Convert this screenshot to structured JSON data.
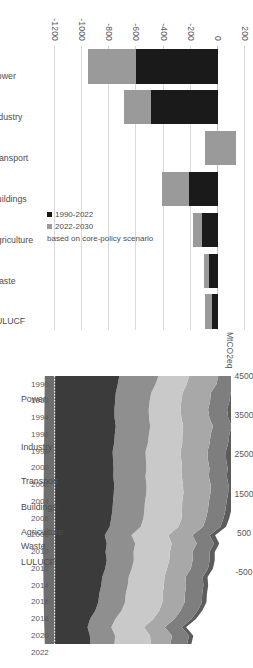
{
  "figures": {
    "bar": {
      "ylabel": "",
      "yticks": [
        "200",
        "0",
        "-200",
        "-400",
        "-600",
        "-800",
        "-1000",
        "-1200"
      ],
      "legend": {
        "hist_label": "1990-2022",
        "proj_label": "2022-2030",
        "note": "based on core-policy scenario"
      }
    },
    "area": {
      "ylabel": "MtCO2eq",
      "yticks": [
        "4500",
        "3500",
        "2500",
        "1500",
        "500",
        "-500"
      ]
    }
  },
  "chart_data": [
    {
      "type": "bar",
      "title": "",
      "xlabel": "",
      "ylabel": "",
      "ylim": [
        -1200,
        200
      ],
      "grid": true,
      "legend_position": "inside-right",
      "categories": [
        "Power",
        "Industry",
        "Transport",
        "Buildings",
        "Agriculture",
        "Waste",
        "LULUCF"
      ],
      "series": [
        {
          "name": "1990-2022",
          "color": "#1a1a1a",
          "values": [
            -600,
            -490,
            135,
            -210,
            -120,
            -65,
            -40
          ]
        },
        {
          "name": "2022-2030",
          "color": "#9a9a9a",
          "values": [
            -360,
            -200,
            -230,
            -205,
            -65,
            -35,
            -55
          ]
        }
      ],
      "annotations": [
        "based on core-policy scenario"
      ]
    },
    {
      "type": "area",
      "stacked": true,
      "title": "",
      "xlabel": "",
      "ylabel": "MtCO2eq",
      "ylim": [
        -500,
        4500
      ],
      "grid": false,
      "x": [
        1990,
        1991,
        1992,
        1993,
        1994,
        1995,
        1996,
        1997,
        1998,
        1999,
        2000,
        2001,
        2002,
        2003,
        2004,
        2005,
        2006,
        2007,
        2008,
        2009,
        2010,
        2011,
        2012,
        2013,
        2014,
        2015,
        2016,
        2017,
        2018,
        2019,
        2020,
        2021,
        2022
      ],
      "xticks": [
        "1990",
        "1992",
        "1994",
        "1996",
        "1998",
        "2000",
        "2002",
        "2004",
        "2006",
        "2008",
        "2010",
        "2012",
        "2014",
        "2016",
        "2018",
        "2020",
        "2022"
      ],
      "series": [
        {
          "name": "Power",
          "color": "#3b3b3b",
          "values": [
            1650,
            1610,
            1560,
            1545,
            1525,
            1530,
            1560,
            1535,
            1520,
            1480,
            1490,
            1505,
            1500,
            1520,
            1510,
            1490,
            1475,
            1445,
            1405,
            1280,
            1330,
            1300,
            1330,
            1290,
            1215,
            1190,
            1140,
            1115,
            1040,
            905,
            840,
            900,
            910
          ]
        },
        {
          "name": "Industry",
          "color": "#8f8f8f",
          "values": [
            1000,
            960,
            905,
            880,
            875,
            880,
            880,
            870,
            860,
            840,
            840,
            835,
            820,
            825,
            830,
            815,
            815,
            820,
            790,
            680,
            725,
            715,
            690,
            675,
            675,
            675,
            675,
            680,
            670,
            645,
            605,
            645,
            615
          ]
        },
        {
          "name": "Transport",
          "color": "#c9c9c9",
          "values": [
            785,
            795,
            800,
            805,
            815,
            825,
            840,
            855,
            875,
            895,
            900,
            910,
            925,
            930,
            945,
            950,
            960,
            975,
            965,
            940,
            930,
            925,
            905,
            900,
            910,
            925,
            940,
            955,
            960,
            965,
            835,
            890,
            925
          ]
        },
        {
          "name": "Buildings",
          "color": "#a8a8a8",
          "values": [
            740,
            760,
            720,
            735,
            700,
            715,
            760,
            720,
            700,
            685,
            680,
            700,
            690,
            705,
            690,
            680,
            660,
            620,
            625,
            615,
            640,
            575,
            595,
            610,
            540,
            565,
            570,
            565,
            545,
            540,
            530,
            560,
            500
          ]
        },
        {
          "name": "Agriculture",
          "color": "#7e7e7e",
          "values": [
            545,
            530,
            505,
            495,
            485,
            480,
            478,
            475,
            472,
            468,
            465,
            463,
            458,
            455,
            452,
            450,
            448,
            447,
            446,
            442,
            440,
            438,
            437,
            436,
            438,
            440,
            441,
            440,
            438,
            435,
            432,
            434,
            430
          ]
        },
        {
          "name": "Waste",
          "color": "#5c5c5c",
          "values": [
            230,
            225,
            220,
            215,
            210,
            205,
            200,
            195,
            190,
            185,
            180,
            175,
            170,
            165,
            160,
            155,
            150,
            146,
            142,
            138,
            135,
            132,
            129,
            126,
            124,
            122,
            120,
            118,
            116,
            114,
            112,
            110,
            108
          ]
        },
        {
          "name": "LULUCF",
          "color": "#6e6e6e",
          "values": [
            -250,
            -252,
            -255,
            -258,
            -260,
            -262,
            -264,
            -266,
            -268,
            -270,
            -272,
            -274,
            -276,
            -278,
            -280,
            -282,
            -284,
            -286,
            -288,
            -290,
            -292,
            -294,
            -290,
            -288,
            -286,
            -284,
            -282,
            -278,
            -272,
            -268,
            -262,
            -258,
            -250
          ]
        }
      ]
    }
  ]
}
